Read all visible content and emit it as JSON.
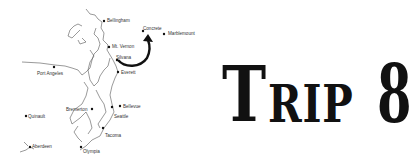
{
  "map": {
    "cities": [
      {
        "name": "Bellingham",
        "x": 104,
        "y": 21,
        "lx": 107,
        "ly": 20
      },
      {
        "name": "Concrete",
        "x": 143,
        "y": 31,
        "lx": 143,
        "ly": 28
      },
      {
        "name": "Marblemount",
        "x": 164,
        "y": 34,
        "lx": 168,
        "ly": 33
      },
      {
        "name": "Mt. Vernon",
        "x": 109,
        "y": 47,
        "lx": 112,
        "ly": 46
      },
      {
        "name": "Silvana",
        "x": 117,
        "y": 60,
        "lx": 116,
        "ly": 57
      },
      {
        "name": "Everett",
        "x": 118,
        "y": 72,
        "lx": 121,
        "ly": 72
      },
      {
        "name": "Port Angeles",
        "x": 54,
        "y": 67,
        "lx": 37,
        "ly": 73
      },
      {
        "name": "Bremerton",
        "x": 92,
        "y": 109,
        "lx": 66,
        "ly": 109
      },
      {
        "name": "Bellevue",
        "x": 120,
        "y": 106,
        "lx": 123,
        "ly": 106
      },
      {
        "name": "Seattle",
        "x": 112,
        "y": 107,
        "lx": 114,
        "ly": 116
      },
      {
        "name": "Tacoma",
        "x": 103,
        "y": 128,
        "lx": 105,
        "ly": 135
      },
      {
        "name": "Olympia",
        "x": 81,
        "y": 147,
        "lx": 83,
        "ly": 151
      },
      {
        "name": "Quinault",
        "x": 26,
        "y": 116,
        "lx": 28,
        "ly": 116
      },
      {
        "name": "Aberdeen",
        "x": 30,
        "y": 147,
        "lx": 32,
        "ly": 146
      }
    ],
    "arrow": {
      "from": "Silvana",
      "to": "Concrete"
    }
  },
  "title": {
    "first_letter": "T",
    "rest": "RIP",
    "number": "8"
  }
}
